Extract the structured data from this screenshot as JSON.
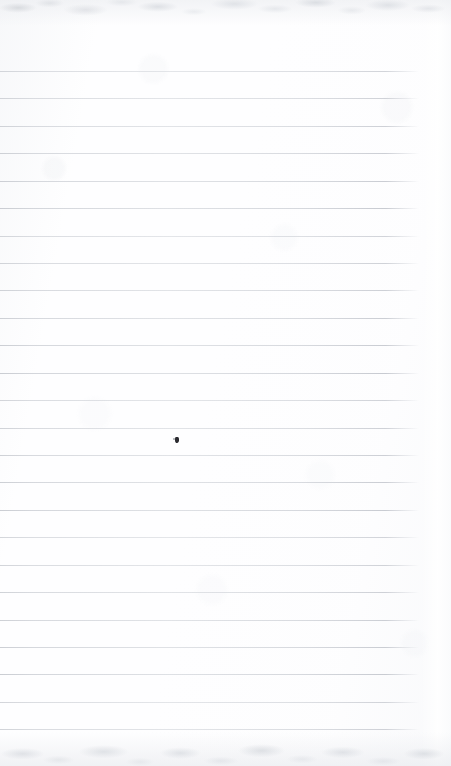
{
  "document": {
    "kind": "scanned-blank-lined-page",
    "description": "Blank ruled notebook page, no handwriting or printed text",
    "width_px": 451,
    "height_px": 766,
    "background_color": "#fefeff",
    "text_content": "",
    "visible_text": []
  },
  "rules": {
    "count": 25,
    "first_line_y": 71,
    "spacing_y": 27.42,
    "line_start_x": 0,
    "line_end_x": 419,
    "line_thickness_px": 1,
    "line_color": "#c9ccd2",
    "positions_y": [
      71,
      98,
      126,
      153,
      181,
      208,
      236,
      263,
      290,
      318,
      345,
      373,
      400,
      428,
      455,
      482,
      510,
      537,
      565,
      592,
      620,
      647,
      674,
      702,
      729
    ]
  },
  "marks": [
    {
      "name": "stray-ink-dot",
      "x": 175,
      "y": 437,
      "width": 4,
      "height": 6,
      "color": "#2b2b30"
    }
  ],
  "edges": {
    "top_texture_height": 26,
    "bottom_texture_height": 34,
    "right_margin_band_width": 30,
    "texture_color": "#d5d8dd"
  }
}
